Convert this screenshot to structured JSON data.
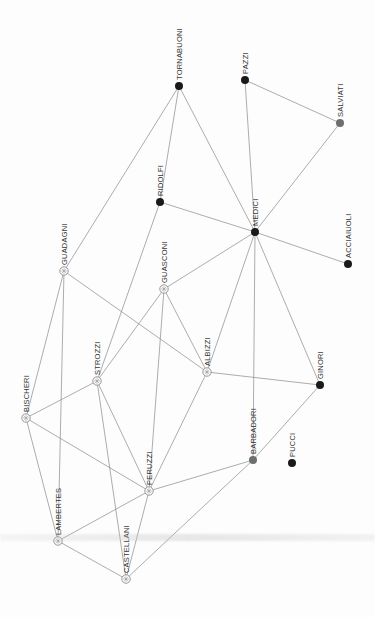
{
  "diagram": {
    "type": "network-graph",
    "orientation": "labels rotated 90deg counter-clockwise",
    "colors": {
      "background": "#fdfdfd",
      "edge": "#8a8a8a",
      "node_dark": "#1a1a1a",
      "node_gray": "#6e6e6e",
      "node_hollow_stroke": "#8a8a8a",
      "label": "#333333"
    },
    "nodes": [
      {
        "id": "tornabuoni",
        "label": "TORNABUONI",
        "x": 179,
        "y": 86,
        "style": "dark"
      },
      {
        "id": "pazzi",
        "label": "PAZZI",
        "x": 245,
        "y": 80,
        "style": "dark"
      },
      {
        "id": "salviati",
        "label": "SALVIATI",
        "x": 340,
        "y": 123,
        "style": "gray"
      },
      {
        "id": "ridolfi",
        "label": "RIDOLFI",
        "x": 160,
        "y": 202,
        "style": "dark"
      },
      {
        "id": "medici",
        "label": "MEDICI",
        "x": 255,
        "y": 232,
        "style": "dark"
      },
      {
        "id": "acciaiuoli",
        "label": "ACCIAIUOLI",
        "x": 348,
        "y": 264,
        "style": "dark"
      },
      {
        "id": "guadagni",
        "label": "GUADAGNI",
        "x": 64,
        "y": 271,
        "style": "hollow"
      },
      {
        "id": "guasconi",
        "label": "GUASCONI",
        "x": 164,
        "y": 289,
        "style": "hollow"
      },
      {
        "id": "albizzi",
        "label": "ALBIZZI",
        "x": 207,
        "y": 372,
        "style": "hollow"
      },
      {
        "id": "strozzi",
        "label": "STROZZI",
        "x": 97,
        "y": 381,
        "style": "hollow"
      },
      {
        "id": "ginori",
        "label": "GINORI",
        "x": 320,
        "y": 385,
        "style": "dark"
      },
      {
        "id": "bischeri",
        "label": "BISCHERI",
        "x": 26,
        "y": 418,
        "style": "hollow"
      },
      {
        "id": "barbadori",
        "label": "BARBADORI",
        "x": 253,
        "y": 460,
        "style": "gray"
      },
      {
        "id": "pucci",
        "label": "PUCCI",
        "x": 292,
        "y": 463,
        "style": "dark"
      },
      {
        "id": "peruzzi",
        "label": "PERUZZI",
        "x": 149,
        "y": 491,
        "style": "hollow"
      },
      {
        "id": "lambertes",
        "label": "LAMBERTES",
        "x": 58,
        "y": 541,
        "style": "hollow"
      },
      {
        "id": "castellani",
        "label": "CASTELLANI",
        "x": 126,
        "y": 579,
        "style": "hollow"
      }
    ],
    "edges": [
      [
        "tornabuoni",
        "guadagni"
      ],
      [
        "tornabuoni",
        "ridolfi"
      ],
      [
        "tornabuoni",
        "medici"
      ],
      [
        "pazzi",
        "salviati"
      ],
      [
        "pazzi",
        "medici"
      ],
      [
        "salviati",
        "medici"
      ],
      [
        "ridolfi",
        "medici"
      ],
      [
        "ridolfi",
        "strozzi"
      ],
      [
        "medici",
        "acciaiuoli"
      ],
      [
        "medici",
        "guasconi"
      ],
      [
        "medici",
        "albizzi"
      ],
      [
        "medici",
        "barbadori"
      ],
      [
        "medici",
        "ginori"
      ],
      [
        "guadagni",
        "albizzi"
      ],
      [
        "guadagni",
        "bischeri"
      ],
      [
        "guadagni",
        "lambertes"
      ],
      [
        "guasconi",
        "strozzi"
      ],
      [
        "guasconi",
        "albizzi"
      ],
      [
        "guasconi",
        "peruzzi"
      ],
      [
        "albizzi",
        "ginori"
      ],
      [
        "albizzi",
        "peruzzi"
      ],
      [
        "strozzi",
        "bischeri"
      ],
      [
        "strozzi",
        "peruzzi"
      ],
      [
        "strozzi",
        "castellani"
      ],
      [
        "ginori",
        "barbadori"
      ],
      [
        "bischeri",
        "peruzzi"
      ],
      [
        "bischeri",
        "lambertes"
      ],
      [
        "barbadori",
        "peruzzi"
      ],
      [
        "barbadori",
        "castellani"
      ],
      [
        "peruzzi",
        "lambertes"
      ],
      [
        "peruzzi",
        "castellani"
      ],
      [
        "lambertes",
        "castellani"
      ]
    ]
  }
}
